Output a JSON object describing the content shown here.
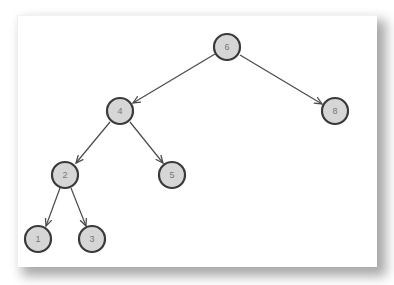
{
  "diagram": {
    "type": "binary-search-tree",
    "nodes": [
      {
        "id": "n6",
        "label": "6",
        "x": 227,
        "y": 47
      },
      {
        "id": "n4",
        "label": "4",
        "x": 120,
        "y": 111
      },
      {
        "id": "n8",
        "label": "8",
        "x": 335,
        "y": 111
      },
      {
        "id": "n2",
        "label": "2",
        "x": 65,
        "y": 175
      },
      {
        "id": "n5",
        "label": "5",
        "x": 172,
        "y": 175
      },
      {
        "id": "n1",
        "label": "1",
        "x": 38,
        "y": 239
      },
      {
        "id": "n3",
        "label": "3",
        "x": 92,
        "y": 239
      }
    ],
    "edges": [
      {
        "from": "6",
        "to": "4"
      },
      {
        "from": "6",
        "to": "8"
      },
      {
        "from": "4",
        "to": "2"
      },
      {
        "from": "4",
        "to": "5"
      },
      {
        "from": "2",
        "to": "1"
      },
      {
        "from": "2",
        "to": "3"
      }
    ],
    "colors": {
      "node_fill": "#d6d6d6",
      "node_stroke": "#3a3a3a",
      "edge": "#4a4a4a",
      "label": "#777777",
      "background": "#ffffff"
    }
  }
}
